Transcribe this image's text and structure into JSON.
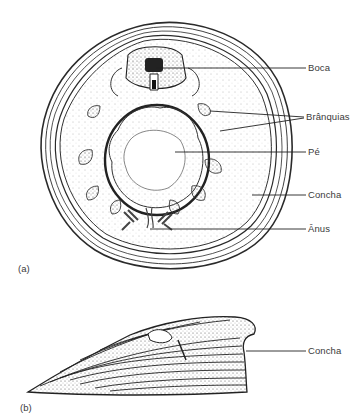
{
  "figure": {
    "panel_a": {
      "tag": "(a)",
      "labels": [
        "Boca",
        "Brânquias",
        "Pé",
        "Concha",
        "Ânus"
      ]
    },
    "panel_b": {
      "tag": "(b)",
      "labels": [
        "Concha"
      ]
    }
  }
}
